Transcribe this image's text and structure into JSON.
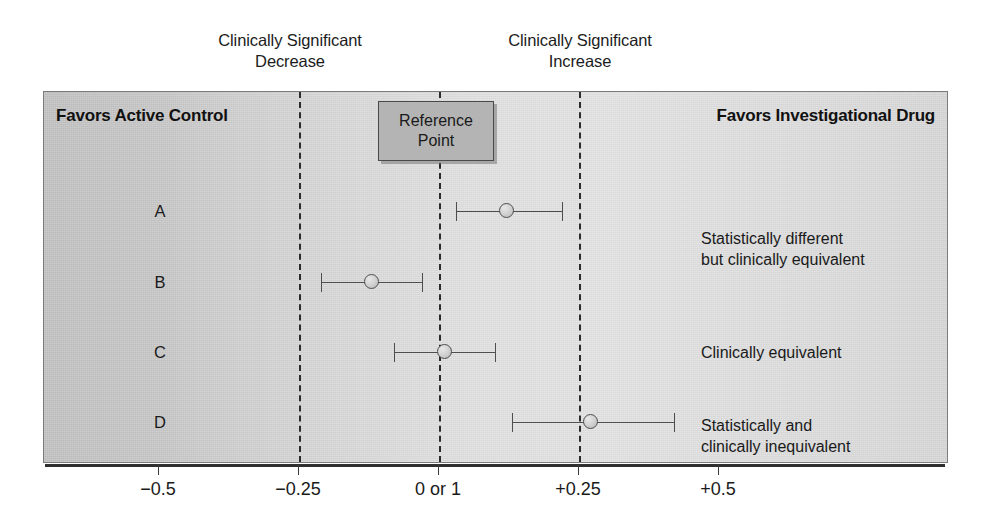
{
  "figure": {
    "type": "forest-plot",
    "captions": {
      "decrease": "Clinically Significant\nDecrease",
      "increase": "Clinically Significant\nIncrease"
    },
    "headers": {
      "left": "Favors Active Control",
      "right": "Favors Investigational Drug"
    },
    "reference_box": {
      "label": "Reference\nPoint",
      "value": "0 or 1",
      "fill_color": "#b4b4b4",
      "border_color": "#4a4a4a"
    }
  },
  "chart_data": {
    "type": "scatter",
    "title": "",
    "xlabel": "",
    "ylabel": "",
    "xlim": [
      -0.625,
      0.82
    ],
    "grid": false,
    "legend_position": "none",
    "axis": {
      "ticks": [
        -0.5,
        -0.25,
        0,
        0.25,
        0.5
      ],
      "tick_labels": [
        "−0.5",
        "−0.25",
        "0 or 1",
        "+0.25",
        "+0.5"
      ]
    },
    "reference_value": 0,
    "equivalence_margins": [
      -0.25,
      0.25
    ],
    "margin_labels": {
      "lower": "Clinically Significant Decrease",
      "upper": "Clinically Significant Increase"
    },
    "categories": [
      "A",
      "B",
      "C",
      "D"
    ],
    "series": [
      {
        "name": "Treatment effect with 95% CI",
        "points": [
          {
            "label": "A",
            "estimate": 0.12,
            "ci_low": 0.03,
            "ci_high": 0.22,
            "note": "Statistically different\nbut clinically equivalent"
          },
          {
            "label": "B",
            "estimate": -0.12,
            "ci_low": -0.21,
            "ci_high": -0.03,
            "note": ""
          },
          {
            "label": "C",
            "estimate": 0.01,
            "ci_low": -0.08,
            "ci_high": 0.1,
            "note": "Clinically equivalent"
          },
          {
            "label": "D",
            "estimate": 0.27,
            "ci_low": 0.13,
            "ci_high": 0.42,
            "note": "Statistically and\nclinically inequivalent"
          }
        ]
      }
    ],
    "colors": {
      "marker_fill": "#cfcfcf",
      "marker_edge": "#4e4e4e",
      "ci_line": "#4e4e4e",
      "threshold_line": "#2b2b2b",
      "axis_line": "#2f2f2f",
      "panel_left": "#c3c3c3",
      "panel_right": "#d8d8d8"
    }
  }
}
